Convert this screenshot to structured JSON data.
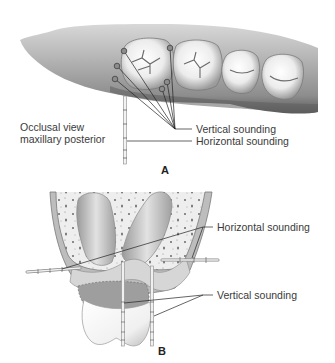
{
  "figure": {
    "panel_a": {
      "letter": "A",
      "view_label_line1": "Occlusal view",
      "view_label_line2": "maxillary posterior",
      "callouts": {
        "vertical": "Vertical sounding",
        "horizontal": "Horizontal sounding"
      },
      "teeth": [
        "first molar",
        "second molar (partial)",
        "premolar",
        "premolar"
      ],
      "probe_points_count": 6
    },
    "panel_b": {
      "letter": "B",
      "callouts": {
        "horizontal": "Horizontal sounding",
        "vertical": "Vertical sounding"
      }
    },
    "colors": {
      "background": "#ffffff",
      "label_text": "#3a3a3a",
      "leader_line": "#222222",
      "gum_tissue": "#9a9a9a",
      "tooth_enamel": "#f4f4f4",
      "bone": "#e6e6e6"
    }
  }
}
